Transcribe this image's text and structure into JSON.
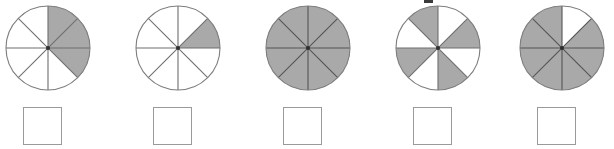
{
  "page": {
    "background_color": "#ffffff",
    "width": 614,
    "height": 149
  },
  "style": {
    "shaded_fill": "#a9a9a9",
    "unshaded_fill": "#ffffff",
    "outline_color": "#7d7d7d",
    "divider_color": "#6e6e6e",
    "shaded_divider_color": "#545454",
    "box_border_color": "#9a9a9a",
    "center_dot_color": "#2f2f2f"
  },
  "geometry": {
    "circle_radius": 42,
    "sector_count": 8,
    "circle_center_x": 46,
    "circle_center_y": 46,
    "group_left_positions": [
      0,
      130,
      260,
      390,
      514
    ]
  },
  "items": [
    {
      "index": 1,
      "name": "fraction-circle-1",
      "sector_count": 8,
      "shaded_count": 3,
      "shaded_sectors": [
        1,
        2,
        3
      ],
      "fraction_label": "3/8",
      "answer_box": {
        "name": "answer-box-1",
        "value": "",
        "placeholder": ""
      }
    },
    {
      "index": 2,
      "name": "fraction-circle-2",
      "sector_count": 8,
      "shaded_count": 1,
      "shaded_sectors": [
        2
      ],
      "fraction_label": "1/8",
      "answer_box": {
        "name": "answer-box-2",
        "value": "",
        "placeholder": ""
      }
    },
    {
      "index": 3,
      "name": "fraction-circle-3",
      "sector_count": 8,
      "shaded_count": 8,
      "shaded_sectors": [
        1,
        2,
        3,
        4,
        5,
        6,
        7,
        8
      ],
      "fraction_label": "8/8",
      "answer_box": {
        "name": "answer-box-3",
        "value": "",
        "placeholder": ""
      }
    },
    {
      "index": 4,
      "name": "fraction-circle-4",
      "sector_count": 8,
      "shaded_count": 4,
      "shaded_sectors": [
        2,
        4,
        6,
        8
      ],
      "fraction_label": "4/8",
      "answer_box": {
        "name": "answer-box-4",
        "value": "",
        "placeholder": ""
      }
    },
    {
      "index": 5,
      "name": "fraction-circle-5",
      "sector_count": 8,
      "shaded_count": 7,
      "shaded_sectors": [
        2,
        3,
        4,
        5,
        6,
        7,
        8
      ],
      "fraction_label": "7/8",
      "answer_box": {
        "name": "answer-box-5",
        "value": "",
        "placeholder": ""
      }
    }
  ]
}
